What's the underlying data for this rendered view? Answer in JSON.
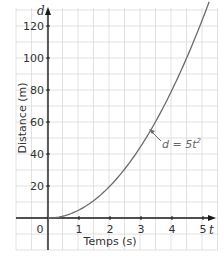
{
  "chart_data": {
    "type": "line",
    "title": "",
    "xlabel": "Temps (s)",
    "ylabel": "Distance (m)",
    "x_axis_var": "t",
    "y_axis_var": "d",
    "xlim": [
      -1,
      5.5
    ],
    "ylim": [
      -20,
      130
    ],
    "x_ticks": [
      "0",
      "1",
      "2",
      "3",
      "4",
      "5"
    ],
    "y_ticks": [
      "20",
      "40",
      "60",
      "80",
      "100",
      "120"
    ],
    "grid": true,
    "series": [
      {
        "name": "d = 5t²",
        "x": [
          0,
          0.5,
          1,
          1.5,
          2,
          2.5,
          3,
          3.5,
          4,
          4.5,
          5
        ],
        "values": [
          0,
          1.25,
          5,
          11.25,
          20,
          31.25,
          45,
          61.25,
          80,
          101.25,
          125
        ]
      }
    ],
    "annotations": [
      {
        "text": "d = 5t²",
        "points_to": {
          "x": 3.6,
          "y": 65
        }
      }
    ]
  },
  "labels": {
    "x_axis_title": "Temps (s)",
    "y_axis_title": "Distance (m)",
    "x_var": "t",
    "y_var": "d",
    "origin": "0",
    "equation_main": "d = 5t",
    "equation_exp": "2"
  },
  "colors": {
    "grid": "#d9d9d9",
    "axis": "#1a1a1a",
    "curve": "#6b6b6b",
    "text": "#333333"
  }
}
